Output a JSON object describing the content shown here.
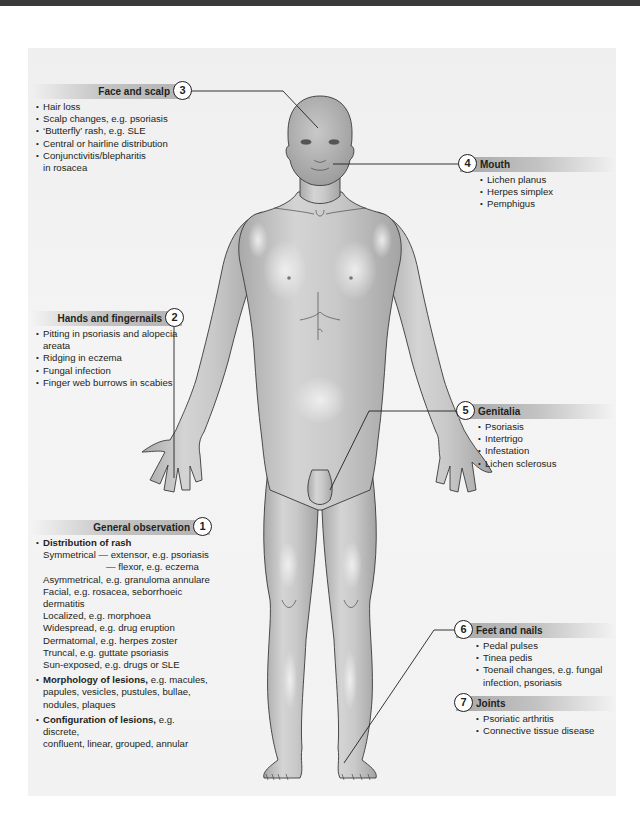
{
  "figure": {
    "colors": {
      "panel_bg": "#f1f1f1",
      "skin": "#bdbdbd",
      "skin_highlight": "#e6e6e6",
      "outline": "#3a3a3a",
      "header_band": "#b8b8b8",
      "leader_line": "#231f20"
    }
  },
  "callouts": {
    "face": {
      "number": "3",
      "title": "Face and scalp",
      "items": [
        "Hair loss",
        "Scalp changes, e.g. psoriasis",
        "‘Butterfly’ rash, e.g. SLE",
        "Central or hairline distribution",
        "Conjunctivitis/blepharitis",
        "in rosacea"
      ]
    },
    "mouth": {
      "number": "4",
      "title": "Mouth",
      "items": [
        "Lichen planus",
        "Herpes simplex",
        "Pemphigus"
      ]
    },
    "hands": {
      "number": "2",
      "title": "Hands and fingernails",
      "items": [
        "Pitting in psoriasis and alopecia",
        "areata",
        "Ridging in eczema",
        "Fungal infection",
        "Finger web burrows in scabies"
      ]
    },
    "genitalia": {
      "number": "5",
      "title": "Genitalia",
      "items": [
        "Psoriasis",
        "Intertrigo",
        "Infestation",
        "Lichen sclerosus"
      ]
    },
    "general": {
      "number": "1",
      "title": "General observation",
      "distribution": {
        "heading": "Distribution of rash",
        "lines": [
          "Symmetrical — extensor, e.g. psoriasis",
          "— flexor, e.g. eczema",
          "Asymmetrical, e.g. granuloma annulare",
          "Facial, e.g. rosacea, seborrhoeic",
          "dermatitis",
          "Localized, e.g. morphoea",
          "Widespread, e.g. drug eruption",
          "Dermatomal, e.g. herpes zoster",
          "Truncal, e.g. guttate psoriasis",
          "Sun-exposed, e.g. drugs or SLE"
        ]
      },
      "morphology": {
        "heading": "Morphology of lesions,",
        "text1": " e.g. macules,",
        "text2": "papules, vesicles, pustules, bullae,",
        "text3": "nodules, plaques"
      },
      "configuration": {
        "heading": "Configuration of lesions,",
        "text1": " e.g. discrete,",
        "text2": "confluent, linear, grouped, annular"
      }
    },
    "feet": {
      "number": "6",
      "title": "Feet and nails",
      "items": [
        "Pedal pulses",
        "Tinea pedis",
        "Toenail changes, e.g. fungal",
        "infection, psoriasis"
      ]
    },
    "joints": {
      "number": "7",
      "title": "Joints",
      "items": [
        "Psoriatic arthritis",
        "Connective tissue disease"
      ]
    }
  }
}
